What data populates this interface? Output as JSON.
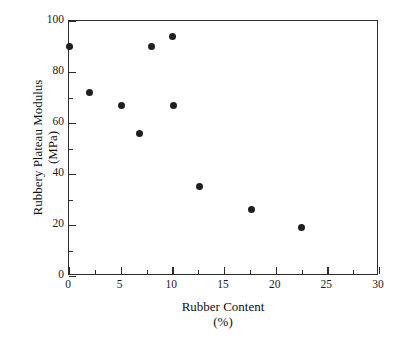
{
  "chart_data": {
    "type": "scatter",
    "title": "",
    "xlabel": "Rubber Content",
    "xlabel_unit": "(%)",
    "ylabel": "Rubbery Plateau Modulus",
    "ylabel_unit": "(MPa)",
    "xlim": [
      0,
      30
    ],
    "ylim": [
      0,
      100
    ],
    "xticks": [
      0,
      5,
      10,
      15,
      20,
      25,
      30
    ],
    "yticks": [
      0,
      20,
      40,
      60,
      80,
      100
    ],
    "x_minor_interval": 2.5,
    "y_minor_interval": 10,
    "grid": false,
    "legend": null,
    "marker": "filled-circle",
    "marker_color": "#1f1f1f",
    "axis_color": "#2b2b2b",
    "background": "#ffffff",
    "points": [
      {
        "x": 0.0,
        "y": 90
      },
      {
        "x": 2.0,
        "y": 72
      },
      {
        "x": 5.1,
        "y": 67
      },
      {
        "x": 6.8,
        "y": 56
      },
      {
        "x": 8.0,
        "y": 90
      },
      {
        "x": 10.0,
        "y": 94
      },
      {
        "x": 10.1,
        "y": 67
      },
      {
        "x": 12.6,
        "y": 35
      },
      {
        "x": 17.7,
        "y": 26
      },
      {
        "x": 22.5,
        "y": 19
      }
    ]
  }
}
